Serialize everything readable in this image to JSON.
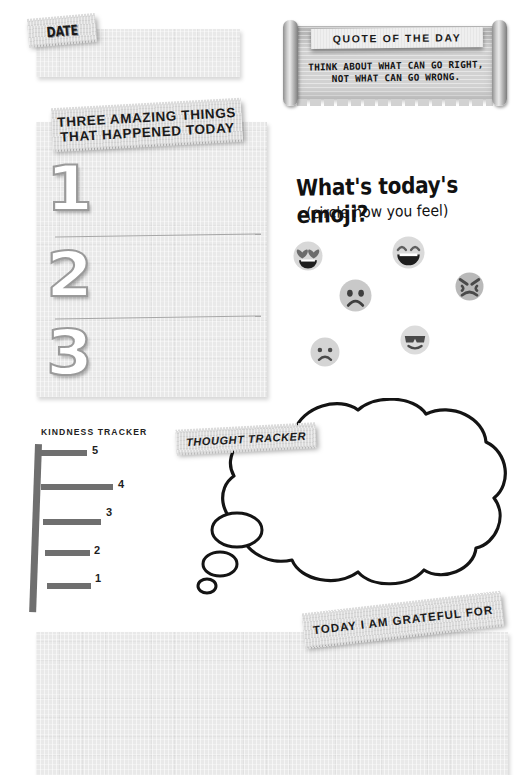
{
  "date_section": {
    "label": "DATE",
    "field_value": ""
  },
  "three_things": {
    "title_line1": "THREE AMAZING THINGS",
    "title_line2": "THAT HAPPENED TODAY",
    "items": [
      {
        "number": "1",
        "value": ""
      },
      {
        "number": "2",
        "value": ""
      },
      {
        "number": "3",
        "value": ""
      }
    ]
  },
  "quote": {
    "title": "QUOTE OF THE DAY",
    "line1": "THINK ABOUT WHAT CAN GO RIGHT,",
    "line2": "NOT WHAT CAN GO WRONG."
  },
  "emoji_section": {
    "title": "What's today's emoji?",
    "subtitle": "(circle how you feel)",
    "options": [
      {
        "name": "heart-eyes-emoji",
        "x": 293,
        "y": 241,
        "size": 30,
        "face": "#d8d8d8",
        "feature": "#6b6b6b"
      },
      {
        "name": "laughing-emoji",
        "x": 392,
        "y": 236,
        "size": 33,
        "face": "#dadada",
        "feature": "#5f5f5f"
      },
      {
        "name": "angry-emoji",
        "x": 455,
        "y": 272,
        "size": 29,
        "face": "#b9b9b9",
        "feature": "#4a4a4a"
      },
      {
        "name": "sad-emoji",
        "x": 339,
        "y": 279,
        "size": 33,
        "face": "#c9c9c9",
        "feature": "#3f3f3f"
      },
      {
        "name": "sunglasses-emoji",
        "x": 400,
        "y": 325,
        "size": 30,
        "face": "#dcdcdc",
        "feature": "#4a4a4a"
      },
      {
        "name": "frowning-emoji",
        "x": 310,
        "y": 337,
        "size": 30,
        "face": "#d4d4d4",
        "feature": "#4a4a4a"
      }
    ]
  },
  "kindness_tracker": {
    "title": "KINDNESS TRACKER",
    "levels": [
      {
        "label": "5",
        "rung_top": 10,
        "rung_left": 11,
        "rung_width": 48,
        "label_left": 64,
        "label_top": 4
      },
      {
        "label": "4",
        "rung_top": 44,
        "rung_left": 13,
        "rung_width": 72,
        "label_left": 90,
        "label_top": 38
      },
      {
        "label": "3",
        "rung_top": 79,
        "rung_left": 15,
        "rung_width": 58,
        "label_left": 78,
        "label_top": 66
      },
      {
        "label": "2",
        "rung_top": 110,
        "rung_left": 17,
        "rung_width": 45,
        "label_left": 66,
        "label_top": 104
      },
      {
        "label": "1",
        "rung_top": 143,
        "rung_left": 19,
        "rung_width": 44,
        "label_left": 67,
        "label_top": 132
      }
    ]
  },
  "thought_tracker": {
    "label": "THOUGHT TRACKER",
    "value": ""
  },
  "grateful": {
    "label": "TODAY I AM GRATEFUL FOR",
    "value": ""
  },
  "colors": {
    "paper": "#e9e9e9",
    "tag": "#dcdcdc",
    "ink": "#1a1a1a",
    "ladder": "#6f6f6f",
    "rule": "#9a9a9a",
    "scroll": "#d2d2d2"
  }
}
